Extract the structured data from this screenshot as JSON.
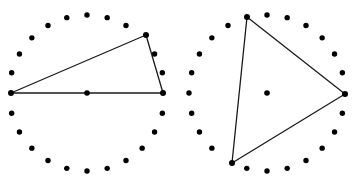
{
  "figure": {
    "canvas": {
      "width": 358,
      "height": 185,
      "background": "#ffffff"
    },
    "style": {
      "dot_color": "#000000",
      "dot_radius": 2.7,
      "center_dot_radius": 2.8,
      "vertex_dot_radius": 3.0,
      "edge_color": "#1a1a1a",
      "edge_width": 1.3
    },
    "panels": [
      {
        "name": "left-figure",
        "label": "Left point-circle with obtuse inscribed triangle",
        "center": {
          "x": 87,
          "y": 93
        },
        "ring": {
          "radius": 78,
          "count": 24,
          "start_angle_deg": 180,
          "direction": "clockwise"
        },
        "center_dot": {
          "x": 87,
          "y": 93
        },
        "triangle": {
          "name": "left-triangle",
          "vertices": [
            {
              "label": "A",
              "x": 11,
              "y": 93,
              "ring_index": 0
            },
            {
              "label": "B",
              "x": 146,
              "y": 35,
              "ring_index": 21
            },
            {
              "label": "C",
              "x": 163,
              "y": 93,
              "ring_index": 0
            }
          ]
        }
      },
      {
        "name": "right-figure",
        "label": "Right point-circle with scalene inscribed triangle",
        "center": {
          "x": 267,
          "y": 93
        },
        "ring": {
          "radius": 78,
          "count": 24,
          "start_angle_deg": 180,
          "direction": "clockwise"
        },
        "center_dot": {
          "x": 267,
          "y": 93
        },
        "triangle": {
          "name": "right-triangle",
          "vertices": [
            {
              "label": "D",
              "x": 247,
              "y": 17,
              "ring_index": 19
            },
            {
              "label": "E",
              "x": 345,
              "y": 94,
              "ring_index": 0
            },
            {
              "label": "F",
              "x": 232,
              "y": 163,
              "ring_index": 7
            }
          ]
        }
      }
    ]
  }
}
